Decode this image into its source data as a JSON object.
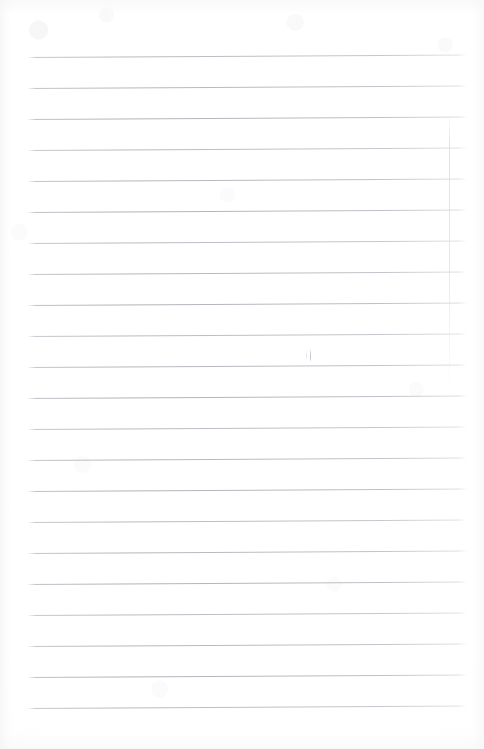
{
  "document": {
    "kind": "lined-notebook-page",
    "title": "Lined notebook page",
    "page_width": 484,
    "page_height": 749,
    "background_color": "#ffffff",
    "content_text": "",
    "is_blank": true
  },
  "ruling": {
    "line_color": "#aeb2b8",
    "line_thickness_px": 1,
    "line_spacing_px": 31,
    "first_line_y": 57,
    "line_left_x": 27,
    "line_right_x": 467,
    "line_tilt_deg": -0.32,
    "line_count": 22,
    "lines_y": [
      57,
      88,
      119,
      150,
      181,
      212,
      243,
      274,
      305,
      336,
      367,
      398,
      429,
      460,
      491,
      522,
      553,
      584,
      615,
      646,
      677,
      708
    ]
  },
  "margin_rule": {
    "present": true,
    "orientation": "vertical",
    "color": "#d8dbe0",
    "x": 449,
    "top_y": 112,
    "bottom_y": 392
  },
  "marks": [
    {
      "name": "stray-pen-mark",
      "x": 310,
      "y": 349,
      "width": 1,
      "height": 13,
      "color": "#bdc0c6"
    },
    {
      "name": "stray-pen-mark-faint",
      "x": 306,
      "y": 351,
      "width": 1,
      "height": 9,
      "color": "#cbced3"
    }
  ]
}
